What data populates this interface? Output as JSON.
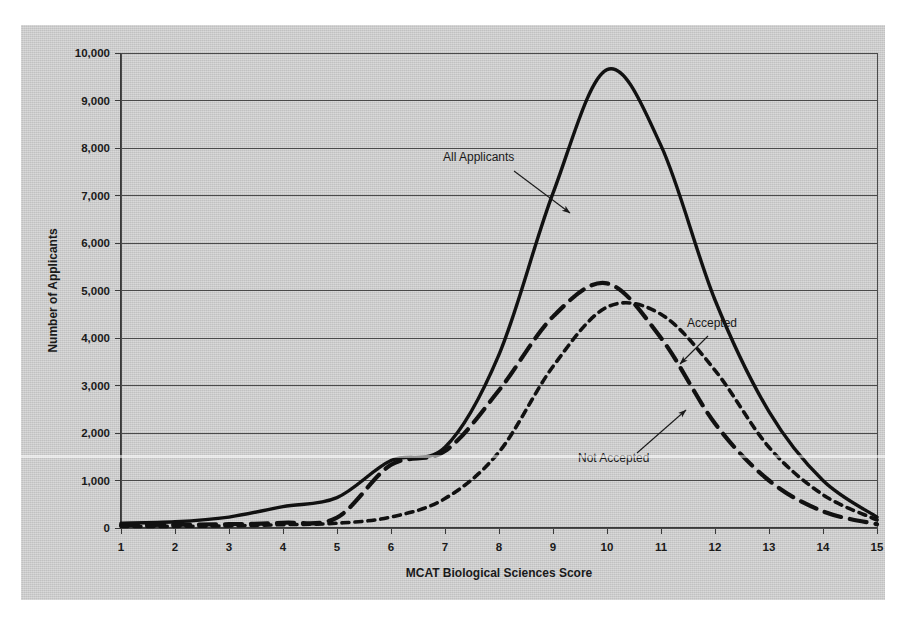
{
  "chart_data": {
    "type": "line",
    "title": "",
    "xlabel": "MCAT Biological Sciences Score",
    "ylabel": "Number of Applicants",
    "xlim": [
      1,
      15
    ],
    "ylim": [
      0,
      10000
    ],
    "grid": true,
    "legend_position": "inline-annotations",
    "x": [
      1,
      2,
      3,
      4,
      5,
      6,
      7,
      8,
      9,
      10,
      11,
      12,
      13,
      14,
      15
    ],
    "xtick_labels": [
      "1",
      "2",
      "3",
      "4",
      "5",
      "6",
      "7",
      "8",
      "9",
      "10",
      "11",
      "12",
      "13",
      "14",
      "15"
    ],
    "ytick_labels": [
      "0",
      "1,000",
      "2,000",
      "3,000",
      "4,000",
      "5,000",
      "6,000",
      "7,000",
      "8,000",
      "9,000",
      "10,000"
    ],
    "ytick_values": [
      0,
      1000,
      2000,
      3000,
      4000,
      5000,
      6000,
      7000,
      8000,
      9000,
      10000
    ],
    "series": [
      {
        "name": "All Applicants",
        "style": "solid",
        "color": "#111111",
        "width": 3.4,
        "values": [
          100,
          130,
          230,
          450,
          640,
          1420,
          1700,
          3650,
          7050,
          9650,
          8050,
          4800,
          2450,
          1000,
          230
        ]
      },
      {
        "name": "Accepted",
        "style": "long-dash",
        "color": "#111111",
        "width": 4.2,
        "values": [
          60,
          70,
          80,
          110,
          220,
          1330,
          1620,
          2900,
          4450,
          5150,
          4000,
          2200,
          1000,
          350,
          80
        ]
      },
      {
        "name": "Not Accepted",
        "style": "short-dash",
        "color": "#111111",
        "width": 3.6,
        "values": [
          30,
          35,
          45,
          70,
          100,
          230,
          620,
          1600,
          3400,
          4650,
          4500,
          3320,
          1700,
          700,
          170
        ]
      }
    ],
    "annotations": [
      {
        "label": "All Applicants",
        "text_x": 422,
        "text_y": 136,
        "arrow_from_x": 493,
        "arrow_from_y": 146,
        "arrow_to_x": 549,
        "arrow_to_y": 188
      },
      {
        "label": "Accepted",
        "text_x": 666,
        "text_y": 302,
        "arrow_from_x": 687,
        "arrow_from_y": 311,
        "arrow_to_x": 659,
        "arrow_to_y": 339
      },
      {
        "label": "Not Accepted",
        "text_x": 557,
        "text_y": 437,
        "arrow_from_x": 616,
        "arrow_from_y": 428,
        "arrow_to_x": 665,
        "arrow_to_y": 385
      }
    ]
  },
  "plot_geometry": {
    "left": 100,
    "right": 856,
    "top": 28,
    "bottom": 503
  }
}
